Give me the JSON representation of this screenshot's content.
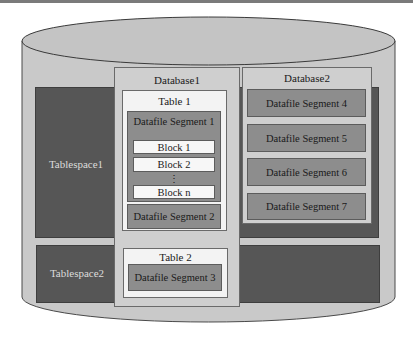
{
  "diagram": {
    "colors": {
      "cylinder": "#c9c9c9",
      "tablespace": "#565656",
      "database": "#cfcfcf",
      "table": "#f3f3f3",
      "segment": "#8d8d8d",
      "block": "#f7f7f7"
    },
    "tablespaces": [
      {
        "label": "Tablespace1"
      },
      {
        "label": "Tablespace2"
      }
    ],
    "databases": [
      {
        "label": "Database1",
        "tables": [
          {
            "label": "Table 1",
            "segments": [
              {
                "label": "Datafile Segment 1",
                "blocks": [
                  "Block 1",
                  "Block 2",
                  "Block n"
                ],
                "ellipsis": "⋮"
              },
              {
                "label": "Datafile Segment 2"
              }
            ]
          },
          {
            "label": "Table 2",
            "segments": [
              {
                "label": "Datafile Segment 3"
              }
            ]
          }
        ]
      },
      {
        "label": "Database2",
        "segments": [
          {
            "label": "Datafile Segment 4"
          },
          {
            "label": "Datafile Segment 5"
          },
          {
            "label": "Datafile Segment 6"
          },
          {
            "label": "Datafile Segment 7"
          }
        ]
      }
    ]
  }
}
